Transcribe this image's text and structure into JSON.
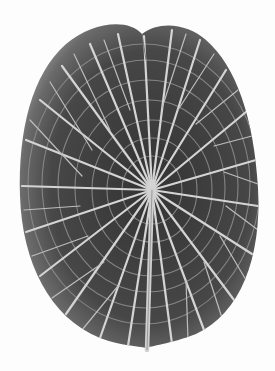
{
  "image": {
    "subject": "Giant water lily leaf, underside with radiating veins",
    "colors": {
      "background": "#fdfdfd",
      "leaf_dark": "#3a3a3a",
      "leaf_mid": "#5e5e5e",
      "leaf_rim": "#8a8a8a",
      "vein": "#d8d8d8"
    },
    "hub": {
      "x": 152,
      "y": 190
    },
    "stem": {
      "x1": 152,
      "y1": 190,
      "x2": 147,
      "y2": 350
    }
  }
}
